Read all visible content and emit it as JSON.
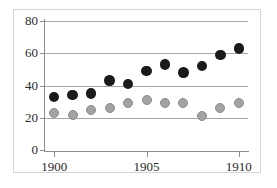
{
  "chart_data": {
    "type": "scatter",
    "title": "",
    "xlabel": "",
    "ylabel": "",
    "x": [
      1900,
      1901,
      1902,
      1903,
      1904,
      1905,
      1906,
      1907,
      1908,
      1909,
      1910
    ],
    "xlim": [
      1899.5,
      1910.5
    ],
    "ylim": [
      0,
      80
    ],
    "xticks": [
      1900,
      1905,
      1910
    ],
    "xticklabels": [
      "1900",
      "1905",
      "1910"
    ],
    "yticks": [
      0,
      20,
      40,
      60,
      80
    ],
    "yticklabels": [
      "0",
      "20",
      "40",
      "60",
      "80"
    ],
    "grid": "horizontal",
    "legend": "none",
    "series": [
      {
        "name": "black-series",
        "color": "#1a1a1a",
        "marker": "circle",
        "values": [
          33,
          34,
          35,
          43,
          41,
          49,
          53,
          48,
          52,
          59,
          63
        ]
      },
      {
        "name": "gray-series",
        "color": "#a3a3a3",
        "marker": "circle",
        "values": [
          23,
          22,
          25,
          26,
          29,
          31,
          29,
          29,
          21,
          26,
          29
        ]
      }
    ]
  },
  "axis": {
    "y_tick_labels": [
      "0",
      "20",
      "40",
      "60",
      "80"
    ],
    "x_tick_labels": [
      "1900",
      "1905",
      "1910"
    ]
  },
  "style": {
    "background": "#ffffff",
    "frame_color": "#d5d5d5",
    "gridline_color": "#a6a6a6",
    "axis_color": "#8c8c8c",
    "text_color": "#2b2b2b"
  }
}
